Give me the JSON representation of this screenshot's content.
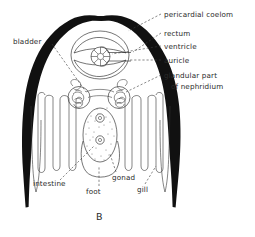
{
  "figure": {
    "caption": "B"
  },
  "colors": {
    "shell": "#111111",
    "line": "#2b2b2b",
    "label_text": "#2a2a2a",
    "leader": "#3a3a3a",
    "background": "#ffffff",
    "stipple": "#6a6a6a"
  },
  "labels": {
    "pericardial_coelom": "pericardial coelom",
    "rectum": "rectum",
    "ventricle": "ventricle",
    "auricle": "auricle",
    "glandular_part": "glandular part",
    "of_nephridium": "of nephridium",
    "bladder": "bladder",
    "intestine": "intestine",
    "foot": "foot",
    "gonad": "gonad",
    "gill": "gill"
  },
  "label_list": [
    {
      "id": "pericardial-coelom",
      "text": "pericardial coelom",
      "side": "right"
    },
    {
      "id": "rectum",
      "text": "rectum",
      "side": "right"
    },
    {
      "id": "ventricle",
      "text": "ventricle",
      "side": "right"
    },
    {
      "id": "auricle",
      "text": "auricle",
      "side": "right"
    },
    {
      "id": "glandular-part-of-nephridium",
      "text": "glandular part of nephridium",
      "side": "right"
    },
    {
      "id": "bladder",
      "text": "bladder",
      "side": "left"
    },
    {
      "id": "intestine",
      "text": "intestine",
      "side": "bottom"
    },
    {
      "id": "foot",
      "text": "foot",
      "side": "bottom"
    },
    {
      "id": "gonad",
      "text": "gonad",
      "side": "bottom"
    },
    {
      "id": "gill",
      "text": "gill",
      "side": "bottom"
    }
  ]
}
